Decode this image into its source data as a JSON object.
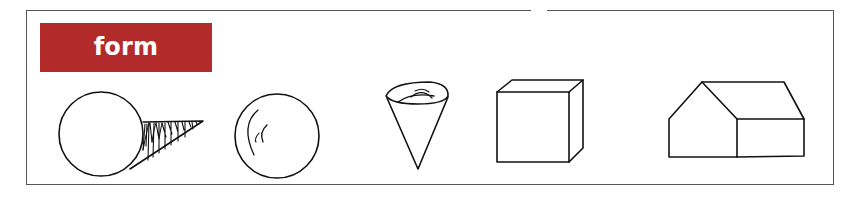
{
  "label": {
    "text": "form",
    "background_color": "#b22a2a",
    "text_color": "#ffffff"
  },
  "frame": {
    "border_color": "#555555"
  },
  "shapes": [
    {
      "name": "sphere-with-cast-shadow",
      "description": "circle with hatched cone-shaped shadow extending right"
    },
    {
      "name": "ball-with-highlight",
      "description": "circle with curved inner highlight strokes"
    },
    {
      "name": "cone",
      "description": "inverted cone with elliptical top opening"
    },
    {
      "name": "cube",
      "description": "cube in oblique projection"
    },
    {
      "name": "house",
      "description": "house with gabled front and side roof"
    }
  ],
  "stroke_color": "#111111"
}
